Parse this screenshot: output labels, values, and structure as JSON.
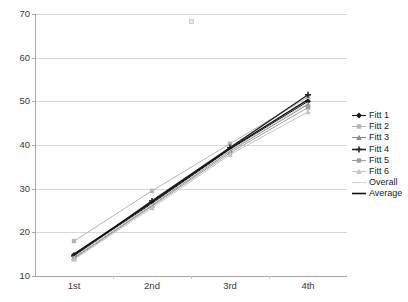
{
  "chart_data": {
    "type": "line",
    "title": "",
    "xlabel": "",
    "ylabel": "",
    "categories": [
      "1st",
      "2nd",
      "3rd",
      "4th"
    ],
    "ylim": [
      10,
      70
    ],
    "yticks": [
      10,
      20,
      30,
      40,
      50,
      60,
      70
    ],
    "grid": true,
    "legend_position": "right",
    "series": [
      {
        "name": "Fitt 1",
        "values": [
          14.8,
          26.6,
          39.0,
          50.0
        ],
        "color": "#1a1a1a",
        "marker": "diamond"
      },
      {
        "name": "Fitt 2",
        "values": [
          18.0,
          29.5,
          40.3,
          51.0
        ],
        "color": "#b4b4b4",
        "marker": "square"
      },
      {
        "name": "Fitt 3",
        "values": [
          14.2,
          26.2,
          38.6,
          49.3
        ],
        "color": "#8a8a8a",
        "marker": "triangle"
      },
      {
        "name": "Fitt 4",
        "values": [
          14.6,
          27.2,
          39.4,
          51.5
        ],
        "color": "#262626",
        "marker": "cross"
      },
      {
        "name": "Fitt 5",
        "values": [
          14.0,
          26.0,
          38.2,
          48.6
        ],
        "color": "#9e9e9e",
        "marker": "square"
      },
      {
        "name": "Fitt 6",
        "values": [
          13.8,
          25.6,
          37.8,
          47.6
        ],
        "color": "#c4c4c4",
        "marker": "triangle"
      },
      {
        "name": "Overall",
        "values": [
          14.4,
          26.4,
          38.8,
          49.6
        ],
        "color": "#d0d0d0",
        "marker": "none"
      },
      {
        "name": "Average",
        "values": [
          15.0,
          26.9,
          39.2,
          50.4
        ],
        "color": "#111111",
        "marker": "none"
      }
    ]
  },
  "axes": {
    "y_tick_labels": [
      "70",
      "60",
      "50",
      "40",
      "30",
      "20",
      "10"
    ],
    "x_tick_labels": [
      "1st",
      "2nd",
      "3rd",
      "4th"
    ]
  },
  "legend": {
    "items": [
      {
        "label": "Fitt 1"
      },
      {
        "label": "Fitt 2"
      },
      {
        "label": "Fitt 3"
      },
      {
        "label": "Fitt 4"
      },
      {
        "label": "Fitt 5"
      },
      {
        "label": "Fitt 6"
      },
      {
        "label": "Overall"
      },
      {
        "label": "Average"
      }
    ]
  },
  "colors": {
    "gridline": "#d9d9d9",
    "axis": "#a8a8a8",
    "background": "#ffffff",
    "text": "#3a3a3a"
  }
}
